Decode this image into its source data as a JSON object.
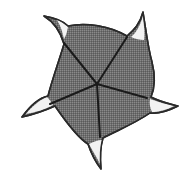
{
  "diagram": {
    "type": "pinwheel-shape",
    "arms": 5,
    "fill": "#707070",
    "outline": "#2a2a2a",
    "tip_fill": "#f4f4f4",
    "spoke_color": "#1a1a1a",
    "center": [
      97,
      84
    ],
    "spokes": [
      {
        "end": [
          64,
          43
        ]
      },
      {
        "end": [
          127,
          37
        ]
      },
      {
        "end": [
          147,
          98
        ]
      },
      {
        "end": [
          100,
          137
        ]
      },
      {
        "end": [
          50,
          104
        ]
      }
    ]
  }
}
